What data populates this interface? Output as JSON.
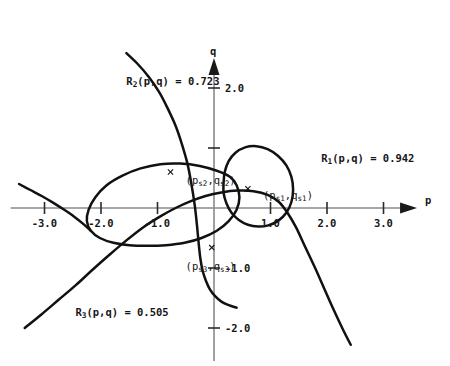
{
  "figure": {
    "axes": {
      "x_axis_label": "p",
      "y_axis_label": "q",
      "x_ticks": [
        "-3.0",
        "-2.0",
        "-1.0",
        "1.0",
        "2.0",
        "3.0"
      ],
      "x_tick_values": [
        -3.0,
        -2.0,
        -1.0,
        1.0,
        2.0,
        3.0
      ],
      "y_ticks": [
        "2.0",
        "-1.0",
        "-2.0"
      ],
      "y_tick_values": [
        2.0,
        -1.0,
        -2.0
      ],
      "y_unlabeled_tick_values": [
        1.0
      ],
      "xlim": [
        -3.6,
        3.7
      ],
      "ylim": [
        -2.55,
        2.6
      ],
      "grid": false,
      "axis_color": "#8a8a8a",
      "curve_color": "#111111"
    },
    "curve_labels": {
      "r1": "R₁(p,q) = 0.942",
      "r2": "R₂(p,q) = 0.723",
      "r3": "R₃(p,q) = 0.505"
    },
    "curve_label_values": {
      "r1": 0.942,
      "r2": 0.723,
      "r3": 0.505
    },
    "point_labels": {
      "s1": "(pₛ₁,qₛ₁)",
      "s2": "(pₛ₂,qₛ₂)",
      "s3": "(pₛ₃,qₛ₃)"
    }
  },
  "chart_data": {
    "type": "line",
    "title": "",
    "xlabel": "p",
    "ylabel": "q",
    "xlim": [
      -3.6,
      3.7
    ],
    "ylim": [
      -2.55,
      2.6
    ],
    "grid": false,
    "legend_position": "inline-annotations",
    "xticks": [
      -3.0,
      -2.0,
      -1.0,
      1.0,
      2.0,
      3.0
    ],
    "xticklabels": [
      "-3.0",
      "-2.0",
      "-1.0",
      "1.0",
      "2.0",
      "3.0"
    ],
    "yticks": [
      2.0,
      1.0,
      -1.0,
      -2.0
    ],
    "yticklabels": [
      "2.0",
      "",
      "-1.0",
      "-2.0"
    ],
    "annotations": [
      {
        "text": "R₁(p,q) = 0.942",
        "x": 1.45,
        "y": 1.1
      },
      {
        "text": "R₂(p,q) = 0.723",
        "x": -2.0,
        "y": 2.38
      },
      {
        "text": "R₃(p,q) = 0.505",
        "x": -2.9,
        "y": -1.47
      },
      {
        "text": "(pₛ₂,qₛ₂)",
        "x": -0.95,
        "y": 0.72
      },
      {
        "text": "(pₛ₁,qₛ₁)",
        "x": 0.42,
        "y": 0.47
      },
      {
        "text": "(pₛ₃,qₛ₃)",
        "x": -0.95,
        "y": -0.7
      }
    ],
    "markers": [
      {
        "name": "s1",
        "x": 0.6,
        "y": 0.32,
        "symbol": "x"
      },
      {
        "name": "s2",
        "x": -0.77,
        "y": 0.6,
        "symbol": "x"
      },
      {
        "name": "s3",
        "x": -0.04,
        "y": -0.66,
        "symbol": "x"
      }
    ],
    "series": [
      {
        "name": "R1",
        "label": "R₁(p,q) = 0.942",
        "closed": true,
        "points": [
          [
            0.17,
            0.42
          ],
          [
            0.19,
            0.6
          ],
          [
            0.26,
            0.78
          ],
          [
            0.38,
            0.92
          ],
          [
            0.55,
            1.01
          ],
          [
            0.75,
            1.03
          ],
          [
            0.95,
            0.98
          ],
          [
            1.13,
            0.87
          ],
          [
            1.28,
            0.71
          ],
          [
            1.37,
            0.52
          ],
          [
            1.4,
            0.31
          ],
          [
            1.37,
            0.1
          ],
          [
            1.28,
            -0.08
          ],
          [
            1.14,
            -0.21
          ],
          [
            0.96,
            -0.29
          ],
          [
            0.78,
            -0.31
          ],
          [
            0.6,
            -0.28
          ],
          [
            0.44,
            -0.2
          ],
          [
            0.31,
            -0.08
          ],
          [
            0.22,
            0.08
          ],
          [
            0.17,
            0.25
          ],
          [
            0.17,
            0.42
          ]
        ]
      },
      {
        "name": "R2",
        "label": "R₂(p,q) = 0.723",
        "closed": false,
        "points": [
          [
            -1.55,
            2.58
          ],
          [
            -1.35,
            2.4
          ],
          [
            -1.15,
            2.18
          ],
          [
            -0.97,
            1.93
          ],
          [
            -0.82,
            1.66
          ],
          [
            -0.68,
            1.37
          ],
          [
            -0.57,
            1.07
          ],
          [
            -0.47,
            0.74
          ],
          [
            -0.4,
            0.4
          ],
          [
            -0.34,
            0.04
          ],
          [
            -0.3,
            -0.3
          ],
          [
            -0.27,
            -0.6
          ],
          [
            -0.24,
            -0.85
          ],
          [
            -0.2,
            -1.05
          ],
          [
            -0.14,
            -1.22
          ],
          [
            -0.07,
            -1.36
          ],
          [
            0.02,
            -1.47
          ],
          [
            0.13,
            -1.56
          ],
          [
            0.26,
            -1.62
          ],
          [
            0.4,
            -1.66
          ]
        ]
      },
      {
        "name": "R2-lobe",
        "label": "R₂(p,q) = 0.723 closed lobe",
        "closed": true,
        "points": [
          [
            0.28,
            0.52
          ],
          [
            0.05,
            0.62
          ],
          [
            -0.25,
            0.7
          ],
          [
            -0.6,
            0.74
          ],
          [
            -0.95,
            0.73
          ],
          [
            -1.3,
            0.66
          ],
          [
            -1.62,
            0.54
          ],
          [
            -1.9,
            0.38
          ],
          [
            -2.1,
            0.18
          ],
          [
            -2.22,
            -0.03
          ],
          [
            -2.25,
            -0.22
          ],
          [
            -2.18,
            -0.38
          ],
          [
            -2.02,
            -0.5
          ],
          [
            -1.78,
            -0.58
          ],
          [
            -1.5,
            -0.62
          ],
          [
            -1.18,
            -0.63
          ],
          [
            -0.85,
            -0.62
          ],
          [
            -0.52,
            -0.58
          ],
          [
            -0.22,
            -0.5
          ],
          [
            0.05,
            -0.38
          ],
          [
            0.26,
            -0.22
          ],
          [
            0.4,
            -0.03
          ],
          [
            0.45,
            0.18
          ],
          [
            0.4,
            0.38
          ],
          [
            0.28,
            0.52
          ]
        ]
      },
      {
        "name": "R3",
        "label": "R₃(p,q) = 0.505",
        "closed": false,
        "points": [
          [
            -3.35,
            -2.0
          ],
          [
            -3.05,
            -1.77
          ],
          [
            -2.75,
            -1.53
          ],
          [
            -2.45,
            -1.29
          ],
          [
            -2.15,
            -1.03
          ],
          [
            -1.85,
            -0.78
          ],
          [
            -1.55,
            -0.54
          ],
          [
            -1.25,
            -0.32
          ],
          [
            -0.95,
            -0.14
          ],
          [
            -0.68,
            0.0
          ],
          [
            -0.42,
            0.11
          ],
          [
            -0.15,
            0.2
          ],
          [
            0.13,
            0.26
          ],
          [
            0.42,
            0.29
          ],
          [
            0.7,
            0.28
          ],
          [
            0.95,
            0.22
          ],
          [
            1.15,
            0.1
          ],
          [
            1.3,
            -0.08
          ],
          [
            1.45,
            -0.32
          ],
          [
            1.6,
            -0.62
          ],
          [
            1.78,
            -0.98
          ],
          [
            1.95,
            -1.34
          ],
          [
            2.12,
            -1.7
          ],
          [
            2.28,
            -2.02
          ],
          [
            2.42,
            -2.28
          ]
        ]
      },
      {
        "name": "R3-upper-left",
        "label": "R₃(p,q) = 0.505 upper branch",
        "closed": false,
        "points": [
          [
            -3.45,
            0.4
          ],
          [
            -3.25,
            0.3
          ],
          [
            -3.05,
            0.2
          ],
          [
            -2.85,
            0.09
          ],
          [
            -2.65,
            -0.03
          ],
          [
            -2.48,
            -0.14
          ],
          [
            -2.32,
            -0.26
          ],
          [
            -2.18,
            -0.38
          ]
        ]
      }
    ]
  }
}
